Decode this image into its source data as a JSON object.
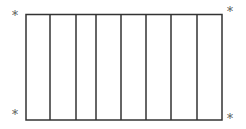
{
  "diagram": {
    "strip_count": 8,
    "line_color": "#333333",
    "box": {
      "x1": 26,
      "y1": 14,
      "x2": 222,
      "y2": 120
    },
    "dividers_x": [
      50,
      76,
      96,
      121,
      146,
      171,
      197
    ],
    "corner_markers": [
      {
        "position": "top-left",
        "symbol": "*"
      },
      {
        "position": "top-right",
        "symbol": "*"
      },
      {
        "position": "bottom-left",
        "symbol": "*"
      },
      {
        "position": "bottom-right",
        "symbol": "*"
      }
    ]
  }
}
